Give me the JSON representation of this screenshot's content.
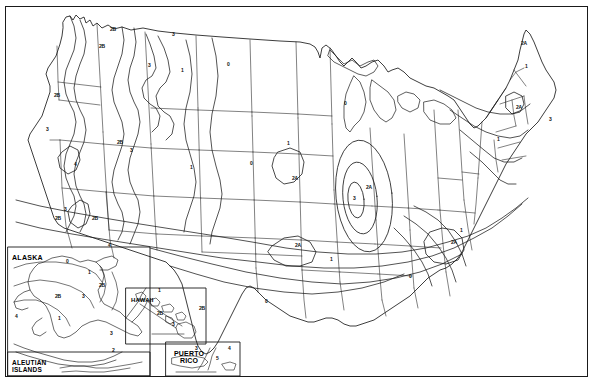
{
  "document": {
    "type": "map",
    "title": "United States Climate Zone Map",
    "background_color": "#ffffff",
    "line_color": "#1a1a1a",
    "frame": "rectangular border"
  },
  "map_data": {
    "type": "contour-zone-map",
    "region": "United States of America",
    "zone_values": [
      "0",
      "1",
      "2A",
      "2B",
      "3",
      "4",
      "5"
    ],
    "insets": [
      {
        "id": "alaska",
        "label": "ALASKA"
      },
      {
        "id": "aleutian",
        "label": "ALEUTIAN\nISLANDS"
      },
      {
        "id": "hawaii",
        "label": "HAWAII"
      },
      {
        "id": "puerto_rico",
        "label": "PUERTO\nRICO"
      }
    ],
    "zone_labels": [
      {
        "id": "l01",
        "text": "2B",
        "x": 99,
        "y": 44
      },
      {
        "id": "l02",
        "text": "3",
        "x": 148,
        "y": 63
      },
      {
        "id": "l03",
        "text": "2B",
        "x": 54,
        "y": 93
      },
      {
        "id": "l04",
        "text": "0",
        "x": 227,
        "y": 62
      },
      {
        "id": "l05",
        "text": "1",
        "x": 181,
        "y": 68
      },
      {
        "id": "l06",
        "text": "0",
        "x": 344,
        "y": 101
      },
      {
        "id": "l07",
        "text": "3",
        "x": 46,
        "y": 127
      },
      {
        "id": "l08",
        "text": "2B",
        "x": 117,
        "y": 140
      },
      {
        "id": "l09",
        "text": "3",
        "x": 130,
        "y": 148
      },
      {
        "id": "l10",
        "text": "4",
        "x": 74,
        "y": 162
      },
      {
        "id": "l11",
        "text": "1",
        "x": 190,
        "y": 165
      },
      {
        "id": "l12",
        "text": "0",
        "x": 250,
        "y": 161
      },
      {
        "id": "l13",
        "text": "2A",
        "x": 292,
        "y": 176
      },
      {
        "id": "l14",
        "text": "1",
        "x": 287,
        "y": 141
      },
      {
        "id": "l15",
        "text": "2A",
        "x": 366,
        "y": 185
      },
      {
        "id": "l16",
        "text": "3",
        "x": 353,
        "y": 196
      },
      {
        "id": "l17",
        "text": "2B",
        "x": 92,
        "y": 216
      },
      {
        "id": "l18",
        "text": "3",
        "x": 64,
        "y": 207
      },
      {
        "id": "l19",
        "text": "4",
        "x": 108,
        "y": 243
      },
      {
        "id": "l20",
        "text": "2A",
        "x": 295,
        "y": 243
      },
      {
        "id": "l21",
        "text": "1",
        "x": 330,
        "y": 257
      },
      {
        "id": "l22",
        "text": "0",
        "x": 265,
        "y": 299
      },
      {
        "id": "l23",
        "text": "2A",
        "x": 451,
        "y": 240
      },
      {
        "id": "l24",
        "text": "1",
        "x": 460,
        "y": 228
      },
      {
        "id": "l25",
        "text": "0",
        "x": 409,
        "y": 274
      },
      {
        "id": "l26",
        "text": "2A",
        "x": 521,
        "y": 41
      },
      {
        "id": "l27",
        "text": "1",
        "x": 525,
        "y": 64
      },
      {
        "id": "l28",
        "text": "2A",
        "x": 516,
        "y": 105
      },
      {
        "id": "l29",
        "text": "3",
        "x": 549,
        "y": 117
      },
      {
        "id": "l30",
        "text": "1",
        "x": 497,
        "y": 137
      },
      {
        "id": "l31",
        "text": "2B",
        "x": 110,
        "y": 27
      },
      {
        "id": "l32",
        "text": "3",
        "x": 172,
        "y": 32
      },
      {
        "id": "l33",
        "text": "0",
        "x": 66,
        "y": 259
      },
      {
        "id": "l34",
        "text": "1",
        "x": 88,
        "y": 270
      },
      {
        "id": "l35",
        "text": "2B",
        "x": 99,
        "y": 283
      },
      {
        "id": "l36",
        "text": "3",
        "x": 82,
        "y": 294
      },
      {
        "id": "l37",
        "text": "1",
        "x": 58,
        "y": 316
      },
      {
        "id": "l38",
        "text": "4",
        "x": 15,
        "y": 314
      },
      {
        "id": "l39",
        "text": "2B",
        "x": 55,
        "y": 294
      },
      {
        "id": "l40",
        "text": "3",
        "x": 110,
        "y": 331
      },
      {
        "id": "l41",
        "text": "2",
        "x": 112,
        "y": 348
      },
      {
        "id": "l42",
        "text": "1",
        "x": 158,
        "y": 288
      },
      {
        "id": "l43",
        "text": "2B",
        "x": 157,
        "y": 311
      },
      {
        "id": "l44",
        "text": "3",
        "x": 172,
        "y": 322
      },
      {
        "id": "l45",
        "text": "3",
        "x": 195,
        "y": 346
      },
      {
        "id": "l46",
        "text": "4",
        "x": 228,
        "y": 346
      },
      {
        "id": "l47",
        "text": "5",
        "x": 216,
        "y": 356
      },
      {
        "id": "l48",
        "text": "2B",
        "x": 55,
        "y": 216
      },
      {
        "id": "l49",
        "text": "2B",
        "x": 199,
        "y": 306
      }
    ]
  }
}
